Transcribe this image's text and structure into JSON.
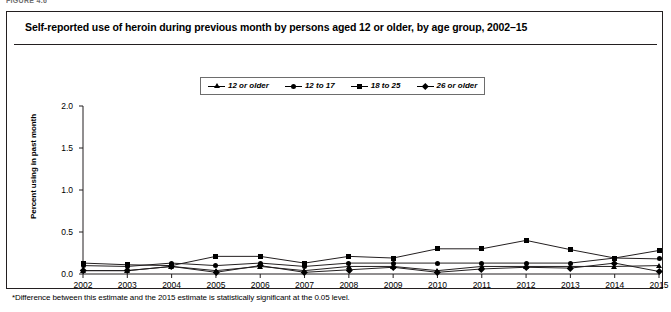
{
  "figure": {
    "eyebrow": "FIGURE 4.6",
    "title": "Self-reported use of heroin during previous month by persons aged 12 or older, by age group, 2002–15",
    "footnote_marker": "*",
    "footnote": "Difference between this estimate and the 2015 estimate is statistically significant at the 0.05 level."
  },
  "legend": {
    "position": "top-center",
    "items": [
      {
        "label": "12 or older",
        "marker": "triangle"
      },
      {
        "label": "12 to 17",
        "marker": "circle"
      },
      {
        "label": "18 to 25",
        "marker": "square"
      },
      {
        "label": "26 or older",
        "marker": "diamond"
      }
    ]
  },
  "chart_data": {
    "type": "line",
    "title": "Self-reported use of heroin during previous month by persons aged 12 or older, by age group, 2002–15",
    "xlabel": "",
    "ylabel": "Percent using in past month",
    "x": [
      2002,
      2003,
      2004,
      2005,
      2006,
      2007,
      2008,
      2009,
      2010,
      2011,
      2012,
      2013,
      2014,
      2015
    ],
    "xtick_labels": [
      "2002",
      "2003",
      "2004",
      "2005",
      "2006",
      "2007",
      "2008",
      "2009",
      "2010",
      "2011",
      "2012",
      "2013",
      "2014",
      "2015"
    ],
    "ytick_labels": [
      "0.0",
      "0.5",
      "1.0",
      "1.5",
      "2.0"
    ],
    "yticks": [
      0.0,
      0.5,
      1.0,
      1.5,
      2.0
    ],
    "ylim": [
      0.0,
      2.0
    ],
    "grid": false,
    "legend_position": "top-center",
    "series": [
      {
        "name": "12 or older",
        "marker": "triangle",
        "values": [
          0.04,
          0.04,
          0.09,
          0.04,
          0.09,
          0.04,
          0.09,
          0.09,
          0.04,
          0.09,
          0.09,
          0.09,
          0.09,
          0.1
        ]
      },
      {
        "name": "12 to 17",
        "marker": "circle",
        "values": [
          0.1,
          0.09,
          0.13,
          0.1,
          0.13,
          0.09,
          0.13,
          0.13,
          0.13,
          0.13,
          0.13,
          0.13,
          0.19,
          0.18
        ]
      },
      {
        "name": "18 to 25",
        "marker": "square",
        "values": [
          0.13,
          0.11,
          0.1,
          0.21,
          0.21,
          0.13,
          0.21,
          0.19,
          0.3,
          0.3,
          0.4,
          0.29,
          0.19,
          0.28
        ]
      },
      {
        "name": "26 or older",
        "marker": "diamond",
        "values": [
          0.04,
          0.04,
          0.09,
          0.02,
          0.1,
          0.02,
          0.05,
          0.08,
          0.02,
          0.06,
          0.08,
          0.07,
          0.13,
          0.03
        ]
      }
    ]
  }
}
